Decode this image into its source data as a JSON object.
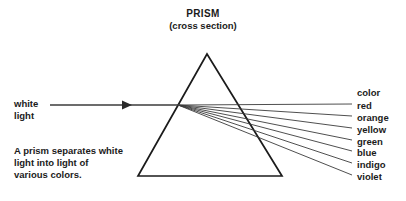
{
  "diagram": {
    "title": "PRISM",
    "subtitle": "(cross section)",
    "incoming_label_line1": "white",
    "incoming_label_line2": "light",
    "caption_line1": "A prism separates white",
    "caption_line2": "light into light of",
    "caption_line3": "various colors.",
    "legend_heading": "color",
    "line_color": "#3b3b3b",
    "prism_stroke": "#1b1b1b",
    "text_color": "#1b1b1b",
    "background": "#ffffff",
    "prism": {
      "apex_x": 207,
      "apex_y": 54,
      "base_left_x": 138,
      "base_left_y": 176,
      "base_right_x": 282,
      "base_right_y": 176
    },
    "incident_ray": {
      "start_x": 50,
      "start_y": 105,
      "end_x": 178,
      "end_y": 105,
      "arrow_x": 128,
      "arrow_y": 105
    },
    "dispersion_point": {
      "x": 178,
      "y": 105
    },
    "colors": [
      {
        "name": "red",
        "label_y": 100,
        "ray_end_x": 352,
        "ray_end_y": 104
      },
      {
        "name": "orange",
        "label_y": 112,
        "ray_end_x": 352,
        "ray_end_y": 116
      },
      {
        "name": "yellow",
        "label_y": 124,
        "ray_end_x": 352,
        "ray_end_y": 128
      },
      {
        "name": "green",
        "label_y": 136,
        "ray_end_x": 352,
        "ray_end_y": 140
      },
      {
        "name": "blue",
        "label_y": 147,
        "ray_end_x": 352,
        "ray_end_y": 151
      },
      {
        "name": "indigo",
        "label_y": 159,
        "ray_end_x": 352,
        "ray_end_y": 163
      },
      {
        "name": "violet",
        "label_y": 171,
        "ray_end_x": 352,
        "ray_end_y": 175
      }
    ]
  }
}
